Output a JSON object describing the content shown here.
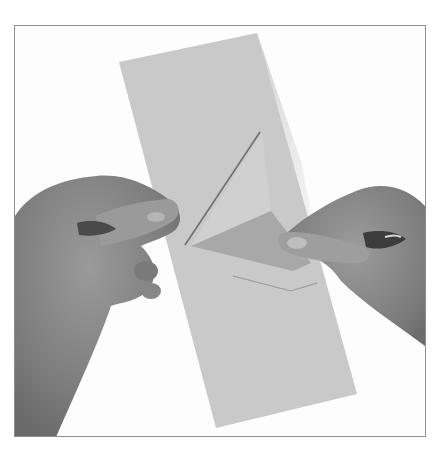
{
  "image": {
    "description": "Grayscale instructional photo: two hands folding a long rectangular strip of paper, forming a triangular fold in the middle",
    "colors": {
      "background": "#fdfdfd",
      "frame": "#8e8e8e",
      "paper": "#c9c9c9",
      "paper_fold": "#d2d2d2",
      "paper_fold_shadow": "#a9a9a9",
      "skin": "#8c8c8c",
      "skin_shadow": "#5a5a5a"
    }
  }
}
